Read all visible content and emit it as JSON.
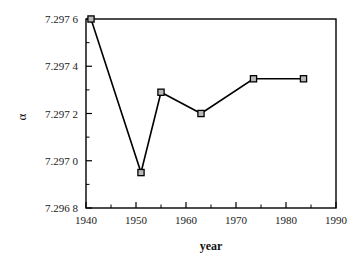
{
  "chart_data": {
    "type": "line",
    "title": "",
    "xlabel": "year",
    "ylabel": "α",
    "xlim": [
      1940,
      1990
    ],
    "ylim": [
      7.2968,
      7.2976
    ],
    "grid": false,
    "legend": null,
    "x": [
      1941,
      1951,
      1955,
      1963,
      1973.5,
      1983.5
    ],
    "values": [
      7.2976,
      7.29695,
      7.29729,
      7.2972,
      7.297347,
      7.297347
    ],
    "series": [
      {
        "name": "alpha",
        "points": [
          {
            "x": 1941,
            "y": 7.2976
          },
          {
            "x": 1951,
            "y": 7.29695
          },
          {
            "x": 1955,
            "y": 7.29729
          },
          {
            "x": 1963,
            "y": 7.2972
          },
          {
            "x": 1973.5,
            "y": 7.297347
          },
          {
            "x": 1983.5,
            "y": 7.297347
          }
        ]
      }
    ],
    "xticks": [
      1940,
      1950,
      1960,
      1970,
      1980,
      1990
    ],
    "xtick_labels": [
      "1940",
      "1950",
      "1960",
      "1970",
      "1980",
      "1990"
    ],
    "xminor_ticks": [
      1945,
      1955,
      1965,
      1975,
      1985
    ],
    "yticks": [
      7.2968,
      7.297,
      7.2972,
      7.2974,
      7.2976
    ],
    "ytick_labels": [
      "7.296 8",
      "7.297 0",
      "7.297 2",
      "7.297 4",
      "7.297 6"
    ],
    "yminor_ticks": [
      7.2969,
      7.2971,
      7.2973,
      7.2975
    ],
    "marker": "square",
    "line_color": "#000000",
    "marker_fill": "#b8b8b8",
    "marker_edge": "#000000"
  }
}
